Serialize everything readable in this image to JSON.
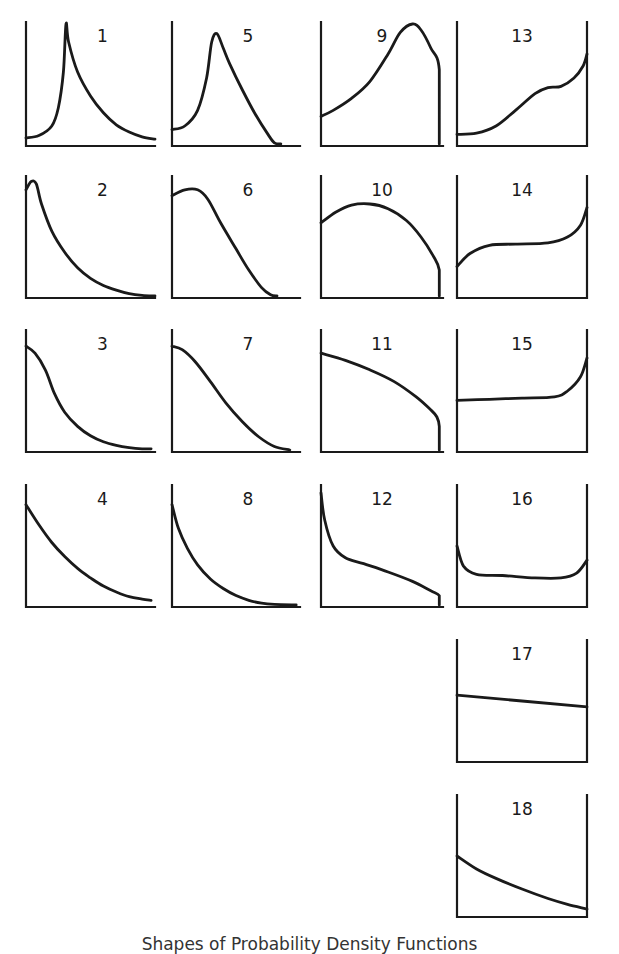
{
  "figure": {
    "caption": "Shapes of Probability Density Functions"
  },
  "chart_data": {
    "type": "line",
    "title": "Shapes of Probability Density Functions",
    "xlabel": "",
    "ylabel": "",
    "grid": false,
    "legend": "none",
    "panels": [
      {
        "id": 1,
        "label": "1",
        "frame": "L",
        "box": [
          26,
          22,
          155,
          146
        ],
        "shape": "sharp central peak, long right tail",
        "points": [
          [
            0,
            0.05
          ],
          [
            0.1,
            0.07
          ],
          [
            0.2,
            0.15
          ],
          [
            0.25,
            0.3
          ],
          [
            0.29,
            0.6
          ],
          [
            0.31,
            1.0
          ],
          [
            0.33,
            0.85
          ],
          [
            0.4,
            0.6
          ],
          [
            0.5,
            0.4
          ],
          [
            0.6,
            0.26
          ],
          [
            0.7,
            0.16
          ],
          [
            0.8,
            0.1
          ],
          [
            0.9,
            0.06
          ],
          [
            1.0,
            0.04
          ]
        ]
      },
      {
        "id": 2,
        "label": "2",
        "frame": "L",
        "box": [
          26,
          176,
          155,
          298
        ],
        "shape": "early peak, decaying tail",
        "points": [
          [
            0,
            0.9
          ],
          [
            0.04,
            0.97
          ],
          [
            0.08,
            0.95
          ],
          [
            0.12,
            0.78
          ],
          [
            0.2,
            0.55
          ],
          [
            0.3,
            0.37
          ],
          [
            0.4,
            0.24
          ],
          [
            0.5,
            0.15
          ],
          [
            0.6,
            0.09
          ],
          [
            0.7,
            0.05
          ],
          [
            0.8,
            0.02
          ],
          [
            0.9,
            0.005
          ],
          [
            1.0,
            0.0
          ]
        ]
      },
      {
        "id": 3,
        "label": "3",
        "frame": "L",
        "box": [
          26,
          330,
          155,
          452
        ],
        "shape": "half-bell decreasing",
        "points": [
          [
            0,
            0.88
          ],
          [
            0.07,
            0.82
          ],
          [
            0.15,
            0.68
          ],
          [
            0.22,
            0.48
          ],
          [
            0.3,
            0.32
          ],
          [
            0.4,
            0.2
          ],
          [
            0.5,
            0.12
          ],
          [
            0.6,
            0.07
          ],
          [
            0.7,
            0.04
          ],
          [
            0.8,
            0.02
          ],
          [
            0.9,
            0.01
          ],
          [
            0.97,
            0.01
          ]
        ]
      },
      {
        "id": 4,
        "label": "4",
        "frame": "L",
        "box": [
          26,
          485,
          155,
          607
        ],
        "shape": "exponential-like decay",
        "points": [
          [
            0,
            0.85
          ],
          [
            0.1,
            0.68
          ],
          [
            0.2,
            0.53
          ],
          [
            0.3,
            0.41
          ],
          [
            0.4,
            0.31
          ],
          [
            0.5,
            0.23
          ],
          [
            0.6,
            0.16
          ],
          [
            0.7,
            0.11
          ],
          [
            0.8,
            0.07
          ],
          [
            0.9,
            0.05
          ],
          [
            0.97,
            0.04
          ]
        ]
      },
      {
        "id": 5,
        "label": "5",
        "frame": "L",
        "box": [
          172,
          22,
          300,
          146
        ],
        "shape": "skewed unimodal peak",
        "points": [
          [
            0,
            0.12
          ],
          [
            0.1,
            0.15
          ],
          [
            0.2,
            0.28
          ],
          [
            0.27,
            0.55
          ],
          [
            0.31,
            0.85
          ],
          [
            0.35,
            0.92
          ],
          [
            0.4,
            0.8
          ],
          [
            0.45,
            0.67
          ],
          [
            0.55,
            0.45
          ],
          [
            0.65,
            0.25
          ],
          [
            0.75,
            0.08
          ],
          [
            0.8,
            0.01
          ],
          [
            0.85,
            0.0
          ]
        ]
      },
      {
        "id": 6,
        "label": "6",
        "frame": "L",
        "box": [
          172,
          176,
          300,
          298
        ],
        "shape": "broad early hump, decreasing",
        "points": [
          [
            0,
            0.85
          ],
          [
            0.1,
            0.9
          ],
          [
            0.2,
            0.9
          ],
          [
            0.28,
            0.82
          ],
          [
            0.38,
            0.62
          ],
          [
            0.5,
            0.4
          ],
          [
            0.6,
            0.22
          ],
          [
            0.7,
            0.07
          ],
          [
            0.77,
            0.01
          ],
          [
            0.82,
            0.0
          ]
        ]
      },
      {
        "id": 7,
        "label": "7",
        "frame": "L",
        "box": [
          172,
          330,
          300,
          452
        ],
        "shape": "smooth half-bell to zero",
        "points": [
          [
            0,
            0.88
          ],
          [
            0.08,
            0.85
          ],
          [
            0.18,
            0.75
          ],
          [
            0.3,
            0.58
          ],
          [
            0.42,
            0.4
          ],
          [
            0.55,
            0.24
          ],
          [
            0.68,
            0.11
          ],
          [
            0.8,
            0.03
          ],
          [
            0.92,
            0.0
          ]
        ]
      },
      {
        "id": 8,
        "label": "8",
        "frame": "L",
        "box": [
          172,
          485,
          300,
          607
        ],
        "shape": "steep decay to zero",
        "points": [
          [
            0,
            0.85
          ],
          [
            0.05,
            0.65
          ],
          [
            0.12,
            0.48
          ],
          [
            0.2,
            0.34
          ],
          [
            0.3,
            0.22
          ],
          [
            0.4,
            0.14
          ],
          [
            0.5,
            0.08
          ],
          [
            0.6,
            0.04
          ],
          [
            0.7,
            0.015
          ],
          [
            0.8,
            0.005
          ],
          [
            0.97,
            0.0
          ]
        ]
      },
      {
        "id": 9,
        "label": "9",
        "frame": "LR-short",
        "box": [
          321,
          22,
          443,
          146
        ],
        "shape": "rising to late peak then truncated",
        "points": [
          [
            0,
            0.23
          ],
          [
            0.1,
            0.28
          ],
          [
            0.25,
            0.38
          ],
          [
            0.4,
            0.52
          ],
          [
            0.55,
            0.75
          ],
          [
            0.65,
            0.93
          ],
          [
            0.75,
            1.0
          ],
          [
            0.82,
            0.95
          ],
          [
            0.9,
            0.8
          ],
          [
            0.97,
            0.62
          ],
          [
            0.97,
            0.0
          ]
        ]
      },
      {
        "id": 10,
        "label": "10",
        "frame": "LR-short",
        "box": [
          321,
          176,
          443,
          298
        ],
        "shape": "dome truncated at right",
        "points": [
          [
            0,
            0.62
          ],
          [
            0.12,
            0.71
          ],
          [
            0.25,
            0.77
          ],
          [
            0.4,
            0.78
          ],
          [
            0.55,
            0.74
          ],
          [
            0.7,
            0.64
          ],
          [
            0.82,
            0.5
          ],
          [
            0.92,
            0.34
          ],
          [
            0.97,
            0.22
          ],
          [
            0.97,
            0.0
          ]
        ]
      },
      {
        "id": 11,
        "label": "11",
        "frame": "LR-short",
        "box": [
          321,
          330,
          443,
          452
        ],
        "shape": "concave decreasing, truncated",
        "points": [
          [
            0,
            0.82
          ],
          [
            0.2,
            0.76
          ],
          [
            0.4,
            0.68
          ],
          [
            0.6,
            0.58
          ],
          [
            0.78,
            0.45
          ],
          [
            0.9,
            0.34
          ],
          [
            0.95,
            0.28
          ],
          [
            0.97,
            0.2
          ],
          [
            0.97,
            0.0
          ]
        ]
      },
      {
        "id": 12,
        "label": "12",
        "frame": "LR-short",
        "box": [
          321,
          485,
          443,
          607
        ],
        "shape": "reverse S decreasing, truncated",
        "points": [
          [
            0,
            0.95
          ],
          [
            0.03,
            0.72
          ],
          [
            0.1,
            0.5
          ],
          [
            0.2,
            0.4
          ],
          [
            0.35,
            0.35
          ],
          [
            0.55,
            0.28
          ],
          [
            0.75,
            0.2
          ],
          [
            0.9,
            0.12
          ],
          [
            0.97,
            0.08
          ],
          [
            0.97,
            0.0
          ]
        ]
      },
      {
        "id": 13,
        "label": "13",
        "frame": "U",
        "box": [
          457,
          22,
          587,
          146
        ],
        "shape": "increasing with shoulder, spike at right",
        "points": [
          [
            0,
            0.08
          ],
          [
            0.15,
            0.09
          ],
          [
            0.3,
            0.15
          ],
          [
            0.45,
            0.28
          ],
          [
            0.6,
            0.42
          ],
          [
            0.7,
            0.47
          ],
          [
            0.8,
            0.48
          ],
          [
            0.9,
            0.55
          ],
          [
            0.97,
            0.65
          ],
          [
            1.0,
            0.75
          ]
        ]
      },
      {
        "id": 14,
        "label": "14",
        "frame": "U",
        "box": [
          457,
          176,
          587,
          298
        ],
        "shape": "rise, plateau, right spike",
        "points": [
          [
            0,
            0.25
          ],
          [
            0.1,
            0.36
          ],
          [
            0.25,
            0.43
          ],
          [
            0.45,
            0.44
          ],
          [
            0.7,
            0.45
          ],
          [
            0.85,
            0.5
          ],
          [
            0.95,
            0.6
          ],
          [
            1.0,
            0.75
          ]
        ]
      },
      {
        "id": 15,
        "label": "15",
        "frame": "U",
        "box": [
          457,
          330,
          587,
          452
        ],
        "shape": "flat with right spike",
        "points": [
          [
            0,
            0.42
          ],
          [
            0.25,
            0.43
          ],
          [
            0.5,
            0.44
          ],
          [
            0.75,
            0.45
          ],
          [
            0.85,
            0.5
          ],
          [
            0.95,
            0.62
          ],
          [
            1.0,
            0.78
          ]
        ]
      },
      {
        "id": 16,
        "label": "16",
        "frame": "U",
        "box": [
          457,
          485,
          587,
          607
        ],
        "shape": "U-shaped, spikes at both ends",
        "points": [
          [
            0,
            0.5
          ],
          [
            0.05,
            0.33
          ],
          [
            0.15,
            0.26
          ],
          [
            0.35,
            0.25
          ],
          [
            0.6,
            0.23
          ],
          [
            0.8,
            0.23
          ],
          [
            0.92,
            0.27
          ],
          [
            1.0,
            0.38
          ]
        ]
      },
      {
        "id": 17,
        "label": "17",
        "frame": "U",
        "box": [
          457,
          640,
          587,
          762
        ],
        "shape": "slightly decreasing line",
        "points": [
          [
            0,
            0.55
          ],
          [
            1.0,
            0.45
          ]
        ]
      },
      {
        "id": 18,
        "label": "18",
        "frame": "U",
        "box": [
          457,
          795,
          587,
          917
        ],
        "shape": "gently decreasing convex curve",
        "points": [
          [
            0,
            0.5
          ],
          [
            0.15,
            0.39
          ],
          [
            0.3,
            0.31
          ],
          [
            0.5,
            0.22
          ],
          [
            0.7,
            0.14
          ],
          [
            0.85,
            0.09
          ],
          [
            1.0,
            0.05
          ]
        ]
      }
    ]
  }
}
